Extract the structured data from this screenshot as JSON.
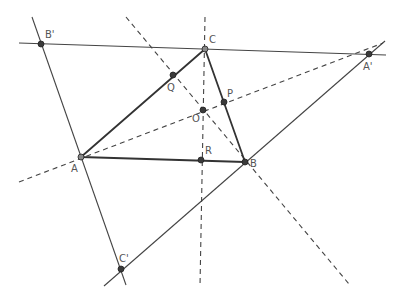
{
  "diagram": {
    "colors": {
      "line": "#444444",
      "triangle": "#333333",
      "dashed": "#444444",
      "point_fill": "#3a3a3a",
      "label": "#555555"
    },
    "points": [
      {
        "id": "B1",
        "label": "B'",
        "x": 41,
        "y": 44,
        "lx": 45,
        "ly": 38
      },
      {
        "id": "C",
        "label": "C",
        "x": 205,
        "y": 49,
        "lx": 209,
        "ly": 43
      },
      {
        "id": "A1",
        "label": "A'",
        "x": 369,
        "y": 54,
        "lx": 363,
        "ly": 70
      },
      {
        "id": "Q",
        "label": "Q",
        "x": 173,
        "y": 75,
        "lx": 167,
        "ly": 91
      },
      {
        "id": "P",
        "label": "P",
        "x": 224,
        "y": 102,
        "lx": 227,
        "ly": 97
      },
      {
        "id": "O",
        "label": "O",
        "x": 203,
        "y": 110,
        "lx": 192,
        "ly": 122
      },
      {
        "id": "A",
        "label": "A",
        "x": 81,
        "y": 157,
        "lx": 71,
        "ly": 172
      },
      {
        "id": "R",
        "label": "R",
        "x": 201,
        "y": 160,
        "lx": 205,
        "ly": 154
      },
      {
        "id": "B",
        "label": "B",
        "x": 245,
        "y": 162,
        "lx": 250,
        "ly": 167
      },
      {
        "id": "C1",
        "label": "C'",
        "x": 121,
        "y": 269,
        "lx": 119,
        "ly": 262
      }
    ]
  }
}
